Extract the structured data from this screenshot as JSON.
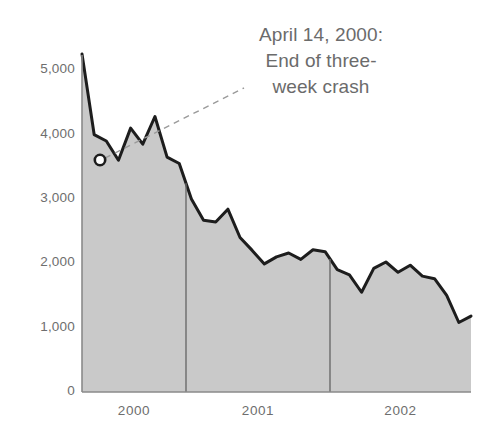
{
  "figure": {
    "background_color": "#ffffff",
    "width": 497,
    "height": 448
  },
  "annotation": {
    "name": "april-14-2000-callout",
    "line1": "April 14, 2000:",
    "line2": "End of three-",
    "line3": "week crash",
    "text_color": "#6b6b6b",
    "leader_style": "dashed",
    "leader_color": "#9a9a9a",
    "marker_style": "open-circle",
    "marker_x_value": "2000-04-14",
    "marker_y_value": 3600
  },
  "axes": {
    "y_tick_labels": [
      "5,000",
      "4,000",
      "3,000",
      "2,000",
      "1,000",
      "0"
    ],
    "y_tick_values": [
      5000,
      4000,
      3000,
      2000,
      1000,
      0
    ],
    "x_tick_labels": [
      "2000",
      "2001",
      "2002"
    ],
    "tick_label_color": "#6e6e6e",
    "axis_line_color": "#8a8a8a",
    "year_divider_color": "#6a6a6a"
  },
  "chart_data": {
    "type": "area",
    "title": "",
    "subtitle": "",
    "xlabel": "",
    "ylabel": "",
    "ylim": [
      0,
      5500
    ],
    "xlim": [
      "1999-10",
      "2002-08"
    ],
    "grid": false,
    "legend": "none",
    "area_fill_color": "#c9c9c9",
    "line_color": "#1d1d1d",
    "line_width": 3,
    "annotations": [
      {
        "label": "April 14, 2000: End of three-week crash",
        "x": "2000-04-14",
        "y": 3600
      }
    ],
    "year_dividers": [
      "2000-06-30",
      "2001-06-30"
    ],
    "x": [
      "1999-11",
      "1999-12",
      "2000-01",
      "2000-02",
      "2000-03",
      "2000-04",
      "2000-05",
      "2000-06",
      "2000-07",
      "2000-08",
      "2000-09",
      "2000-10",
      "2000-11",
      "2000-12",
      "2001-01",
      "2001-02",
      "2001-03",
      "2001-04",
      "2001-05",
      "2001-06",
      "2001-07",
      "2001-08",
      "2001-09",
      "2001-10",
      "2001-11",
      "2001-12",
      "2002-01",
      "2002-02",
      "2002-03",
      "2002-04",
      "2002-05",
      "2002-06",
      "2002-07"
    ],
    "values": [
      5250,
      4000,
      3900,
      3600,
      4100,
      3850,
      4280,
      3650,
      3550,
      3000,
      2670,
      2640,
      2840,
      2400,
      2200,
      1990,
      2100,
      2160,
      2060,
      2210,
      2180,
      1900,
      1820,
      1550,
      1920,
      2020,
      1860,
      1970,
      1800,
      1760,
      1500,
      1080,
      1180
    ],
    "series": [
      {
        "name": "NASDAQ Composite",
        "values": [
          5250,
          4000,
          3900,
          3600,
          4100,
          3850,
          4280,
          3650,
          3550,
          3000,
          2670,
          2640,
          2840,
          2400,
          2200,
          1990,
          2100,
          2160,
          2060,
          2210,
          2180,
          1900,
          1820,
          1550,
          1920,
          2020,
          1860,
          1970,
          1800,
          1760,
          1500,
          1080,
          1180
        ]
      }
    ]
  }
}
